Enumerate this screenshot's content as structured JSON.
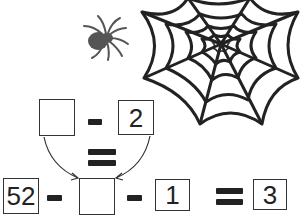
{
  "puzzle": {
    "top_row": {
      "left_box": "",
      "operator": "minus",
      "right_box": "2"
    },
    "middle_operator": "equals",
    "bottom_row": {
      "first_box": "52",
      "op1": "minus",
      "blank_box": "",
      "op2": "minus",
      "third_box": "1",
      "op3": "equals",
      "result_box": "3"
    }
  },
  "illustrations": {
    "spider": "spider-icon",
    "web": "spider-web-icon"
  },
  "colors": {
    "ink": "#222222",
    "spider": "#555555",
    "background": "#ffffff"
  }
}
